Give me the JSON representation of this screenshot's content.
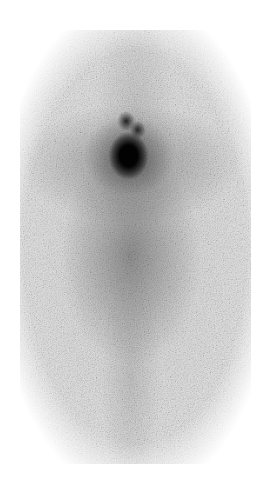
{
  "image": {
    "kind": "grayscale scintigraphy scan",
    "background_color": "#ffffff",
    "scan_base_color": "#e6e6e6",
    "hotspot_color": "#000000"
  }
}
